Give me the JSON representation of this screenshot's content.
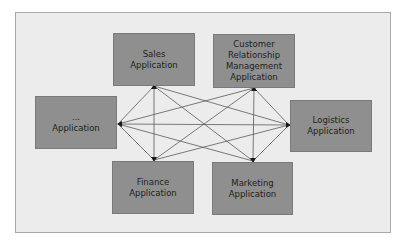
{
  "diagram": {
    "type": "point-to-point integration",
    "nodes": [
      {
        "id": "sales",
        "label": "Sales\nApplication"
      },
      {
        "id": "crm",
        "label": "Customer\nRelationship\nManagement\nApplication"
      },
      {
        "id": "other",
        "label": "...\nApplication"
      },
      {
        "id": "logistics",
        "label": "Logistics\nApplication"
      },
      {
        "id": "finance",
        "label": "Finance\nApplication"
      },
      {
        "id": "marketing",
        "label": "Marketing\nApplication"
      }
    ],
    "edges": [
      {
        "from": "sales",
        "to": "crm"
      },
      {
        "from": "sales",
        "to": "other"
      },
      {
        "from": "sales",
        "to": "logistics"
      },
      {
        "from": "sales",
        "to": "finance"
      },
      {
        "from": "sales",
        "to": "marketing"
      },
      {
        "from": "crm",
        "to": "other"
      },
      {
        "from": "crm",
        "to": "logistics"
      },
      {
        "from": "crm",
        "to": "finance"
      },
      {
        "from": "crm",
        "to": "marketing"
      },
      {
        "from": "other",
        "to": "logistics"
      },
      {
        "from": "other",
        "to": "finance"
      },
      {
        "from": "other",
        "to": "marketing"
      },
      {
        "from": "logistics",
        "to": "finance"
      },
      {
        "from": "logistics",
        "to": "marketing"
      }
    ],
    "colors": {
      "node_fill": "#8f8f8f",
      "background": "#ececec",
      "line": "#555555",
      "arrowhead": "#1a1a1a"
    }
  }
}
